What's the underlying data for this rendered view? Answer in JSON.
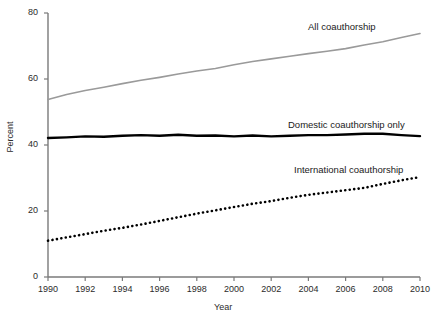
{
  "chart_data": {
    "type": "line",
    "title": "",
    "xlabel": "Year",
    "ylabel": "Percent",
    "xlim": [
      1990,
      2010
    ],
    "ylim": [
      0,
      80
    ],
    "xticks": [
      1990,
      1992,
      1994,
      1996,
      1998,
      2000,
      2002,
      2004,
      2006,
      2008,
      2010
    ],
    "yticks": [
      0,
      20,
      40,
      60,
      80
    ],
    "grid": false,
    "legend_position": "inline-annotation",
    "x": [
      1990,
      1991,
      1992,
      1993,
      1994,
      1995,
      1996,
      1997,
      1998,
      1999,
      2000,
      2001,
      2002,
      2003,
      2004,
      2005,
      2006,
      2007,
      2008,
      2009,
      2010
    ],
    "series": [
      {
        "name": "All coauthorship",
        "color": "#9a9a9a",
        "style": "solid",
        "width": 1.6,
        "values": [
          53.8,
          55.3,
          56.5,
          57.5,
          58.6,
          59.6,
          60.5,
          61.5,
          62.4,
          63.2,
          64.3,
          65.3,
          66.1,
          66.9,
          67.7,
          68.4,
          69.2,
          70.3,
          71.3,
          72.6,
          73.8
        ]
      },
      {
        "name": "Domestic coauthorship only",
        "color": "#000000",
        "style": "solid",
        "width": 2.4,
        "values": [
          42.1,
          42.3,
          42.6,
          42.5,
          42.8,
          43.0,
          42.8,
          43.1,
          42.8,
          42.9,
          42.6,
          42.9,
          42.6,
          42.8,
          43.0,
          43.0,
          43.2,
          43.4,
          43.4,
          43.0,
          42.7
        ]
      },
      {
        "name": "International coauthorship",
        "color": "#000000",
        "style": "dotted",
        "width": 2.6,
        "values": [
          11.0,
          12.0,
          13.0,
          14.0,
          14.9,
          15.9,
          17.0,
          18.1,
          19.2,
          20.2,
          21.2,
          22.2,
          23.0,
          24.0,
          24.9,
          25.6,
          26.3,
          27.0,
          28.2,
          29.3,
          30.3
        ]
      }
    ],
    "annotations": [
      {
        "text": "All coauthorship",
        "x_px": 308,
        "y_px": 21
      },
      {
        "text": "Domestic coauthorship only",
        "x_px": 288,
        "y_px": 119
      },
      {
        "text": "International coauthorship",
        "x_px": 294,
        "y_px": 164
      }
    ]
  },
  "axis": {
    "y_title": "Percent",
    "x_title": "Year",
    "y_tick_labels": [
      "0",
      "20",
      "40",
      "60",
      "80"
    ],
    "x_tick_labels": [
      "1990",
      "1992",
      "1994",
      "1996",
      "1998",
      "2000",
      "2002",
      "2004",
      "2006",
      "2008",
      "2010"
    ]
  }
}
